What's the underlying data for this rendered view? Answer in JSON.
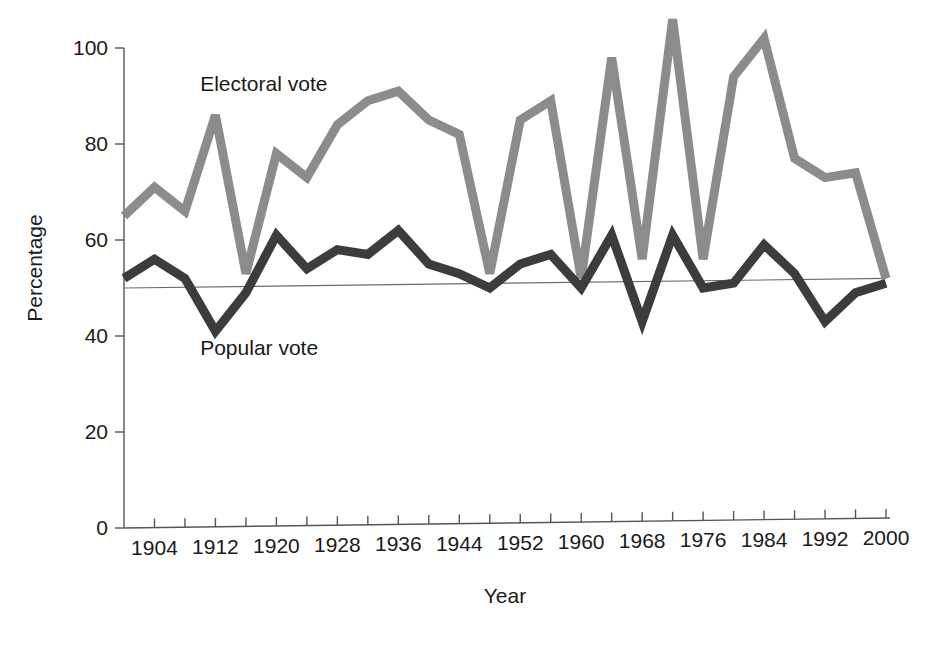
{
  "chart_data": {
    "type": "line",
    "title": "",
    "subtitle": "",
    "xlabel": "Year",
    "ylabel": "Percentage",
    "xlim": [
      1900,
      2000
    ],
    "ylim": [
      0,
      100
    ],
    "grid": false,
    "legend_position": "inline-annotation",
    "x": [
      1900,
      1904,
      1908,
      1912,
      1916,
      1920,
      1924,
      1928,
      1932,
      1936,
      1940,
      1944,
      1948,
      1952,
      1956,
      1960,
      1964,
      1968,
      1972,
      1976,
      1980,
      1984,
      1988,
      1992,
      1996,
      2000
    ],
    "x_tick_values": [
      1900,
      1904,
      1908,
      1912,
      1916,
      1920,
      1924,
      1928,
      1932,
      1936,
      1940,
      1944,
      1948,
      1952,
      1956,
      1960,
      1964,
      1968,
      1972,
      1976,
      1980,
      1984,
      1988,
      1992,
      1996,
      2000
    ],
    "x_tick_labels": [
      "1904",
      "1912",
      "1920",
      "1928",
      "1936",
      "1944",
      "1952",
      "1960",
      "1968",
      "1976",
      "1984",
      "1992",
      "2000"
    ],
    "x_labeled_values": [
      1904,
      1912,
      1920,
      1928,
      1936,
      1944,
      1952,
      1960,
      1968,
      1976,
      1984,
      1992,
      2000
    ],
    "y_tick_values": [
      0,
      20,
      40,
      60,
      80,
      100
    ],
    "y_tick_labels": [
      "0",
      "20",
      "40",
      "60",
      "80",
      "100"
    ],
    "reference_line": {
      "name": "fifty-percent-trend-line",
      "start_value": 50,
      "end_value": 52,
      "color": "#6a6a6a"
    },
    "series": [
      {
        "name": "Electoral vote",
        "color": "#8c8c8c",
        "stroke_width": 9,
        "annotation": {
          "text": "Electoral vote",
          "x": 1910,
          "y": 91
        },
        "values": [
          65,
          71,
          66,
          86,
          53,
          78,
          73,
          84,
          89,
          91,
          85,
          82,
          53,
          85,
          89,
          52,
          98,
          56,
          106,
          56,
          94,
          102,
          77,
          73,
          74,
          52
        ]
      },
      {
        "name": "Popular vote",
        "color": "#3c3c3c",
        "stroke_width": 9,
        "annotation": {
          "text": "Popular vote",
          "x": 1910,
          "y": 36
        },
        "values": [
          52,
          56,
          52,
          41,
          49,
          61,
          54,
          58,
          57,
          62,
          55,
          53,
          50,
          55,
          57,
          50,
          61,
          43,
          61,
          50,
          51,
          59,
          53,
          43,
          49,
          51
        ]
      }
    ]
  },
  "axes": {
    "y_title": "Percentage",
    "x_title": "Year"
  }
}
